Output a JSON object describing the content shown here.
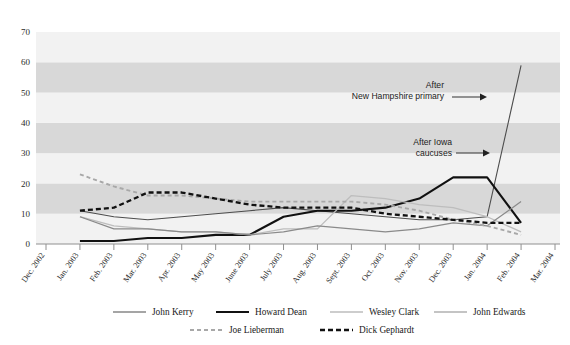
{
  "chart_data": {
    "type": "line",
    "title": "",
    "xlabel": "",
    "ylabel": "",
    "ylim": [
      0,
      70
    ],
    "ytick_step": 10,
    "grid": "horizontal-banded",
    "legend_position": "bottom",
    "yticks": [
      "0",
      "10",
      "20",
      "30",
      "40",
      "50",
      "60",
      "70"
    ],
    "categories": [
      "Dec. 2002",
      "Jan. 2003",
      "Feb. 2003",
      "Mar. 2003",
      "Apr. 2003",
      "May 2003",
      "June 2003",
      "July 2003",
      "Aug. 2003",
      "Sept. 2003",
      "Oct. 2003",
      "Nov. 2003",
      "Dec. 2003",
      "Jan. 2004",
      "Feb. 2004",
      "Mar. 2004"
    ],
    "series": [
      {
        "name": "John Kerry",
        "color": "#4d4d4d",
        "width": 1.1,
        "dash": "none",
        "values": [
          null,
          11,
          9,
          8,
          9,
          10,
          11,
          12,
          11,
          10,
          9,
          8,
          8,
          9,
          59,
          null
        ]
      },
      {
        "name": "Howard Dean",
        "color": "#111111",
        "width": 2.1,
        "dash": "none",
        "values": [
          null,
          1,
          1,
          2,
          2,
          3,
          3,
          9,
          11,
          11,
          12,
          15,
          22,
          22,
          7,
          null
        ]
      },
      {
        "name": "Wesley Clark",
        "color": "#bdbdbd",
        "width": 1.3,
        "dash": "none",
        "values": [
          null,
          9,
          6,
          5,
          4,
          4,
          3,
          5,
          5,
          16,
          15,
          13,
          12,
          9,
          4,
          null
        ]
      },
      {
        "name": "John Edwards",
        "color": "#8a8a8a",
        "width": 1.2,
        "dash": "none",
        "values": [
          null,
          9,
          5,
          5,
          4,
          4,
          3,
          4,
          6,
          5,
          4,
          5,
          7,
          6,
          14,
          null
        ]
      },
      {
        "name": "Joe Lieberman",
        "color": "#a8a8a8",
        "width": 1.9,
        "dash": "dashed-light",
        "values": [
          null,
          23,
          19,
          16,
          16,
          15,
          14,
          14,
          14,
          14,
          13,
          11,
          8,
          6,
          3,
          null
        ]
      },
      {
        "name": "Dick Gephardt",
        "color": "#111111",
        "width": 2.3,
        "dash": "dashed-heavy",
        "values": [
          null,
          11,
          12,
          17,
          17,
          15,
          13,
          12,
          12,
          12,
          10,
          9,
          8,
          7,
          7,
          null
        ]
      }
    ],
    "annotations": [
      {
        "id": "new-hampshire",
        "lines": [
          "After",
          "New Hampshire primary"
        ],
        "arrow": "right"
      },
      {
        "id": "iowa",
        "lines": [
          "After Iowa",
          "caucuses"
        ],
        "arrow": "right"
      }
    ]
  },
  "legend": {
    "row1": [
      "John Kerry",
      "Howard Dean",
      "Wesley Clark",
      "John Edwards"
    ],
    "row2": [
      "Joe Lieberman",
      "Dick Gephardt"
    ]
  }
}
